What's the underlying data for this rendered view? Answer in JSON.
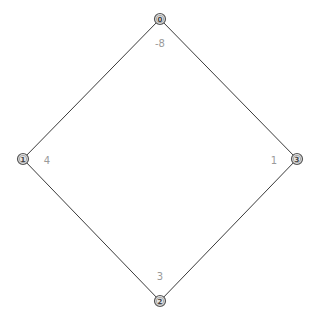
{
  "diagram": {
    "type": "graph",
    "colors": {
      "edge": "#3a3a3a",
      "node_fill": "#e4e4e4",
      "node_stroke": "#555555",
      "label": "#9a9a9a"
    },
    "nodes": [
      {
        "id": "0",
        "label": "0",
        "x": 160,
        "y": 19,
        "value": "-8",
        "value_x": 160,
        "value_y": 43
      },
      {
        "id": "1",
        "label": "1",
        "x": 23,
        "y": 159,
        "value": "4",
        "value_x": 47,
        "value_y": 160
      },
      {
        "id": "2",
        "label": "2",
        "x": 160,
        "y": 301,
        "value": "3",
        "value_x": 160,
        "value_y": 276
      },
      {
        "id": "3",
        "label": "3",
        "x": 297,
        "y": 159,
        "value": "1",
        "value_x": 274,
        "value_y": 160
      }
    ],
    "edges": [
      {
        "from": "0",
        "to": "1"
      },
      {
        "from": "0",
        "to": "3"
      },
      {
        "from": "1",
        "to": "2"
      },
      {
        "from": "3",
        "to": "2"
      }
    ]
  }
}
